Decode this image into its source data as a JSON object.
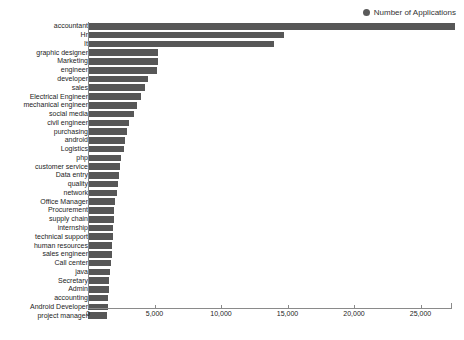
{
  "legend": {
    "marker": "circle-marker",
    "label": "Number of Applications",
    "position": "top-right",
    "color": "#5a5a5a"
  },
  "axis": {
    "x_ticks": [
      "0",
      "5,000",
      "10,000",
      "15,000",
      "20,000",
      "25,000"
    ],
    "x_tick_values": [
      0,
      5000,
      10000,
      15000,
      20000,
      25000
    ]
  },
  "chart_data": {
    "type": "bar",
    "orientation": "horizontal",
    "title": "",
    "subtitle": "",
    "xlabel": "",
    "ylabel": "",
    "xlim": [
      0,
      27400
    ],
    "grid": false,
    "legend_position": "top-right",
    "bar_color": "#575757",
    "series_name": "Number of Applications",
    "categories": [
      "accountant",
      "Hr",
      "It",
      "graphic designer",
      "Marketing",
      "engineer",
      "developer",
      "sales",
      "Electrical Engineer",
      "mechanical engineer",
      "social media",
      "civil engineer",
      "purchasing",
      "android",
      "Logistics",
      "php",
      "customer service",
      "Data entry",
      "quality",
      "network",
      "Office Manager",
      "Procurement",
      "supply chain",
      "internship",
      "technical support",
      "human resources",
      "sales engineer",
      "Call center",
      "java",
      "Secretary",
      "Admin",
      "accounting",
      "Android Developer",
      "project manager"
    ],
    "values": [
      27600,
      14700,
      14000,
      5250,
      5250,
      5180,
      4500,
      4280,
      4000,
      3700,
      3450,
      3050,
      2950,
      2800,
      2700,
      2500,
      2400,
      2300,
      2250,
      2150,
      2050,
      1980,
      1920,
      1880,
      1850,
      1820,
      1780,
      1700,
      1620,
      1580,
      1550,
      1530,
      1500,
      1450
    ]
  }
}
